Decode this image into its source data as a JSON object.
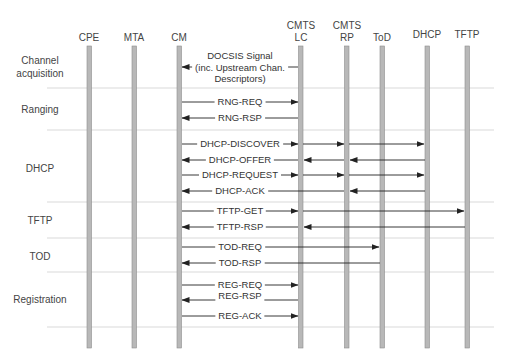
{
  "diagram": {
    "type": "sequence",
    "entities": [
      {
        "id": "cpe",
        "label": "CPE",
        "x": 89
      },
      {
        "id": "mta",
        "label": "MTA",
        "x": 134
      },
      {
        "id": "cm",
        "label": "CM",
        "x": 179
      },
      {
        "id": "cmts_lc",
        "label": "CMTS\nLC",
        "line1": "CMTS",
        "line2": "LC",
        "x": 301
      },
      {
        "id": "cmts_rp",
        "label": "CMTS\nRP",
        "line1": "CMTS",
        "line2": "RP",
        "x": 347
      },
      {
        "id": "tod",
        "label": "ToD",
        "x": 382
      },
      {
        "id": "dhcp",
        "label": "DHCP",
        "x": 427
      },
      {
        "id": "tftp",
        "label": "TFTP",
        "x": 467
      }
    ],
    "phases": [
      {
        "id": "channel",
        "line1": "Channel",
        "line2": "acquisition"
      },
      {
        "id": "ranging",
        "line1": "Ranging"
      },
      {
        "id": "dhcp",
        "line1": "DHCP"
      },
      {
        "id": "tftp",
        "line1": "TFTP"
      },
      {
        "id": "tod",
        "line1": "TOD"
      },
      {
        "id": "registration",
        "line1": "Registration"
      }
    ],
    "messages": [
      {
        "line1": "DOCSIS Signal",
        "line2": "(inc. Upstream Chan.",
        "line3": "Descriptors)",
        "from": "CMTS LC",
        "to": "CM"
      },
      {
        "label": "RNG-REQ",
        "from": "CM",
        "to": "CMTS LC"
      },
      {
        "label": "RNG-RSP",
        "from": "CMTS LC",
        "to": "CM"
      },
      {
        "label": "DHCP-DISCOVER",
        "from": "CM",
        "to": "DHCP",
        "via": [
          "CMTS LC",
          "CMTS RP"
        ]
      },
      {
        "label": "DHCP-OFFER",
        "from": "DHCP",
        "to": "CM",
        "via": [
          "CMTS RP",
          "CMTS LC"
        ]
      },
      {
        "label": "DHCP-REQUEST",
        "from": "CM",
        "to": "DHCP",
        "via": [
          "CMTS LC",
          "CMTS RP"
        ]
      },
      {
        "label": "DHCP-ACK",
        "from": "DHCP",
        "to": "CM",
        "via": [
          "CMTS RP"
        ]
      },
      {
        "label": "TFTP-GET",
        "from": "CM",
        "to": "TFTP",
        "via": [
          "CMTS LC"
        ]
      },
      {
        "label": "TFTP-RSP",
        "from": "TFTP",
        "to": "CM",
        "via": [
          "CMTS LC"
        ]
      },
      {
        "label": "TOD-REQ",
        "from": "CM",
        "to": "ToD"
      },
      {
        "label": "TOD-RSP",
        "from": "ToD",
        "to": "CM"
      },
      {
        "label": "REG-REQ",
        "from": "CM",
        "to": "CMTS LC"
      },
      {
        "label": "REG-RSP",
        "from": "CMTS LC",
        "to": "CM"
      },
      {
        "label": "REG-ACK",
        "from": "CM",
        "to": "CMTS LC"
      }
    ],
    "colors": {
      "lifeline": "#b4b4b4",
      "lifeline_border": "#8a8a8a",
      "arrow": "#222222",
      "separator": "#c8c8c8"
    }
  }
}
